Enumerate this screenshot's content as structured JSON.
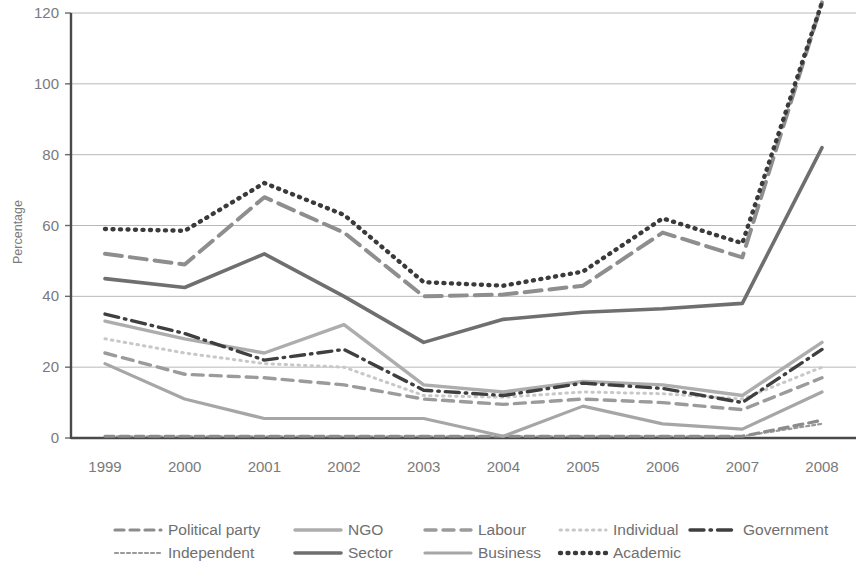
{
  "chart_data": {
    "type": "line",
    "title": "",
    "subtitle": "",
    "xlabel": "",
    "ylabel": "Percentage",
    "categories": [
      "1999",
      "2000",
      "2001",
      "2002",
      "2003",
      "2004",
      "2005",
      "2006",
      "2007",
      "2008"
    ],
    "x": [
      1999,
      2000,
      2001,
      2002,
      2003,
      2004,
      2005,
      2006,
      2007,
      2008
    ],
    "xlim": [
      1999,
      2008
    ],
    "ylim": [
      0,
      120
    ],
    "yticks": [
      0,
      20,
      40,
      60,
      80,
      100,
      120
    ],
    "xticks": [
      "1999",
      "2000",
      "2001",
      "2002",
      "2003",
      "2004",
      "2005",
      "2006",
      "2007",
      "2008"
    ],
    "grid": "horizontal",
    "legend_position": "bottom",
    "legend_columns": 5,
    "series": [
      {
        "name": "Political party",
        "style": "dashed",
        "color": "#8c8c8c",
        "width": 3.2,
        "dash": "9,6",
        "values": [
          0.5,
          0.5,
          0.5,
          0.5,
          0.5,
          0.5,
          0.5,
          0.5,
          0.5,
          5
        ]
      },
      {
        "name": "Independent",
        "style": "fine-dashed",
        "color": "#9a9a9a",
        "width": 2.2,
        "dash": "3,3",
        "values": [
          0.5,
          0.5,
          0.5,
          0.5,
          0.5,
          0.5,
          0.5,
          0.5,
          0.5,
          4
        ]
      },
      {
        "name": "NGO",
        "style": "solid",
        "color": "#adadad",
        "width": 3.4,
        "dash": "none",
        "values": [
          33,
          28,
          24,
          32,
          15,
          13,
          16,
          15,
          12,
          27
        ]
      },
      {
        "name": "Sector",
        "style": "solid",
        "color": "#6f6f6f",
        "width": 3.6,
        "dash": "none",
        "values": [
          45,
          42.5,
          52,
          40,
          27,
          33.5,
          35.5,
          36.5,
          38,
          82
        ]
      },
      {
        "name": "Labour",
        "style": "dashed",
        "color": "#9b9b9b",
        "width": 3.4,
        "dash": "11,7",
        "values": [
          24,
          18,
          17,
          15,
          11,
          9.5,
          11,
          10,
          8,
          17
        ]
      },
      {
        "name": "Business",
        "style": "solid",
        "color": "#a6a6a6",
        "width": 3.2,
        "dash": "none",
        "values": [
          21,
          11,
          5.5,
          5.5,
          5.5,
          0.5,
          9,
          4,
          2.5,
          13
        ]
      },
      {
        "name": "Individual",
        "style": "dotted",
        "color": "#c8c8c8",
        "width": 3.0,
        "dash": "1.5,5",
        "values": [
          28,
          24,
          21,
          20,
          12,
          11.5,
          13,
          12.5,
          11,
          20
        ]
      },
      {
        "name": "Academic",
        "style": "dotted",
        "color": "#3a3a3a",
        "width": 4.4,
        "dash": "1,6.5",
        "values": [
          59,
          58.5,
          72,
          63,
          44,
          43,
          47,
          62,
          55,
          123
        ]
      },
      {
        "name": "Government",
        "style": "dash-dot",
        "color": "#3f3f3f",
        "width": 3.4,
        "dash": "14,6,1.5,6",
        "values": [
          35,
          29.5,
          22,
          25,
          13.5,
          12,
          15.5,
          14,
          10,
          25
        ]
      },
      {
        "name": "Labour-upper",
        "style": "dashed",
        "color": "#8e8e8e",
        "width": 4.0,
        "dash": "17,8",
        "values": [
          52,
          49,
          68,
          58,
          40,
          40.5,
          43,
          58,
          51,
          123
        ],
        "hidden_from_legend": true
      }
    ],
    "legend": [
      {
        "label": "Political party",
        "key": "political-party"
      },
      {
        "label": "NGO",
        "key": "ngo"
      },
      {
        "label": "Labour",
        "key": "labour"
      },
      {
        "label": "Individual",
        "key": "individual"
      },
      {
        "label": "Government",
        "key": "government"
      },
      {
        "label": "Independent",
        "key": "independent"
      },
      {
        "label": "Sector",
        "key": "sector"
      },
      {
        "label": "Business",
        "key": "business"
      },
      {
        "label": "Academic",
        "key": "academic"
      }
    ]
  }
}
